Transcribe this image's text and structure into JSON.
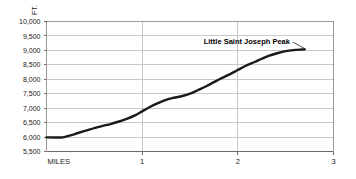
{
  "chart_data": {
    "type": "line",
    "title": "",
    "xlabel": "MILES",
    "ylabel": "FT.",
    "xlim": [
      0,
      3
    ],
    "ylim": [
      5500,
      10000
    ],
    "grid": true,
    "legend": null,
    "y_ticks": [
      "10,000",
      "9,500",
      "9,000",
      "8,500",
      "8,000",
      "7,500",
      "7,000",
      "6,500",
      "6,000",
      "5,500"
    ],
    "y_tick_values": [
      10000,
      9500,
      9000,
      8500,
      8000,
      7500,
      7000,
      6500,
      6000,
      5500
    ],
    "x_ticks": [
      "1",
      "2",
      "3"
    ],
    "x_tick_values": [
      1,
      2,
      3
    ],
    "x_origin_label": "MILES",
    "series": [
      {
        "name": "Trail elevation profile",
        "color": "#1a1a1a",
        "x": [
          0.0,
          0.08,
          0.17,
          0.25,
          0.33,
          0.42,
          0.5,
          0.58,
          0.67,
          0.75,
          0.83,
          0.92,
          1.0,
          1.08,
          1.17,
          1.25,
          1.33,
          1.42,
          1.5,
          1.58,
          1.67,
          1.75,
          1.83,
          1.92,
          2.0,
          2.08,
          2.17,
          2.25,
          2.33,
          2.42,
          2.5,
          2.58,
          2.67,
          2.7
        ],
        "y": [
          5990,
          5985,
          5990,
          6060,
          6140,
          6230,
          6310,
          6380,
          6450,
          6530,
          6620,
          6740,
          6890,
          7040,
          7180,
          7290,
          7360,
          7420,
          7500,
          7620,
          7760,
          7900,
          8040,
          8180,
          8320,
          8460,
          8590,
          8710,
          8820,
          8910,
          8975,
          9010,
          9030,
          9035
        ]
      }
    ],
    "annotations": [
      {
        "text": "Little Saint Joseph Peak",
        "value": 9035,
        "text_x": 2.545,
        "text_y": 9310,
        "leader_from_x": 2.575,
        "leader_from_y": 9290,
        "leader_to_x": 2.7,
        "leader_to_y": 9060
      }
    ]
  }
}
